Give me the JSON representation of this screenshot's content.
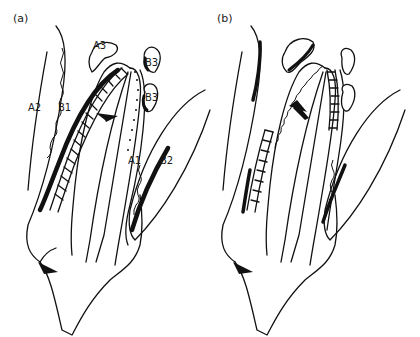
{
  "figure": {
    "panels": [
      {
        "id": "a",
        "label": "(a)",
        "labels": {
          "A1": "A1",
          "A2": "A2",
          "A3": "A3",
          "B1": "B1",
          "B2": "B2",
          "B3_upper": "B3",
          "B3_lower": "B3"
        },
        "force_arrow": "crown-tip-toward-right",
        "apex_arrow": "apex-toward-right"
      },
      {
        "id": "b",
        "label": "(b)",
        "labels": {},
        "force_arrow": "crown-tip-toward-left",
        "apex_arrow": "apex-toward-right"
      }
    ],
    "colors": {
      "ink": "#111111",
      "background": "#ffffff"
    }
  }
}
